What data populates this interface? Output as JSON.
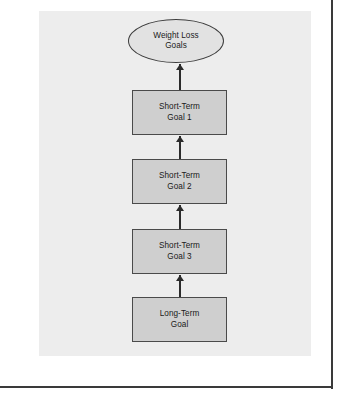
{
  "figure": {
    "title": "",
    "panel_background": "#ededed",
    "page_background": "#ffffff",
    "border_color": "#3a3a3a"
  },
  "diagram": {
    "type": "flowchart",
    "orientation": "vertical-bottom-to-top",
    "nodes": [
      {
        "id": "weight-loss-goals",
        "shape": "ellipse",
        "label": "Weight Loss\nGoals",
        "fill": "#e2e2e2",
        "stroke": "#3d3d3d",
        "x": 128,
        "y": 19,
        "width": 96,
        "height": 44
      },
      {
        "id": "short-term-goal-1",
        "shape": "rectangle",
        "label": "Short-Term\nGoal 1",
        "fill": "#cfcfcf",
        "stroke": "#4a4a4a",
        "x": 132,
        "y": 90,
        "width": 95,
        "height": 45
      },
      {
        "id": "short-term-goal-2",
        "shape": "rectangle",
        "label": "Short-Term\nGoal 2",
        "fill": "#cfcfcf",
        "stroke": "#4a4a4a",
        "x": 132,
        "y": 159,
        "width": 95,
        "height": 45
      },
      {
        "id": "short-term-goal-3",
        "shape": "rectangle",
        "label": "Short-Term\nGoal 3",
        "fill": "#cfcfcf",
        "stroke": "#4a4a4a",
        "x": 132,
        "y": 229,
        "width": 95,
        "height": 45
      },
      {
        "id": "long-term-goal",
        "shape": "rectangle",
        "label": "Long-Term\nGoal",
        "fill": "#cfcfcf",
        "stroke": "#4a4a4a",
        "x": 132,
        "y": 297,
        "width": 95,
        "height": 45
      }
    ],
    "edges": [
      {
        "id": "edge-goal1-to-weightloss",
        "from": "short-term-goal-1",
        "to": "weight-loss-goals",
        "direction": "up",
        "x": 179,
        "y": 64,
        "length": 26
      },
      {
        "id": "edge-goal2-to-goal1",
        "from": "short-term-goal-2",
        "to": "short-term-goal-1",
        "direction": "up",
        "x": 179,
        "y": 136,
        "length": 23
      },
      {
        "id": "edge-goal3-to-goal2",
        "from": "short-term-goal-3",
        "to": "short-term-goal-2",
        "direction": "up",
        "x": 179,
        "y": 205,
        "length": 24
      },
      {
        "id": "edge-longterm-to-goal3",
        "from": "long-term-goal",
        "to": "short-term-goal-3",
        "direction": "up",
        "x": 179,
        "y": 275,
        "length": 22
      }
    ]
  }
}
